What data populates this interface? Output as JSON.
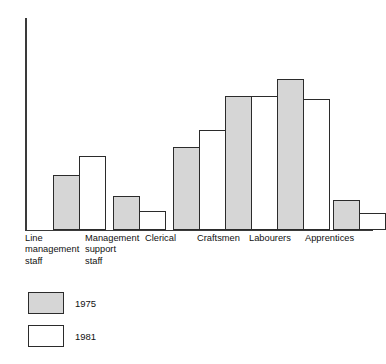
{
  "chart_data": {
    "type": "bar",
    "title": "",
    "xlabel": "",
    "ylabel": "Number of employees",
    "grid": false,
    "legend_position": "bottom-left",
    "y_axis_ticks": [],
    "ylim": [
      0,
      100
    ],
    "categories": [
      "Line\nmanagement\nstaff",
      "Management\nsupport\nstaff",
      "Clerical",
      "Craftsmen",
      "Labourers",
      "Apprentices"
    ],
    "series": [
      {
        "name": "1975",
        "color": "#d6d6d6",
        "values": [
          26,
          16,
          39,
          63,
          71,
          14
        ]
      },
      {
        "name": "1981",
        "color": "#ffffff",
        "values": [
          35,
          9,
          47,
          63,
          62,
          8
        ]
      }
    ]
  },
  "legend": {
    "entries": [
      {
        "label": "1975",
        "swatch": "shaded"
      },
      {
        "label": "1981",
        "swatch": "white"
      }
    ]
  },
  "axes": {
    "y_label": "Number of employees"
  },
  "colors": {
    "series_1975": "#d6d6d6",
    "series_1981": "#ffffff",
    "outline": "#2b2b2b",
    "axis": "#3a3a3a",
    "text": "#111111",
    "background": "#ffffff"
  }
}
